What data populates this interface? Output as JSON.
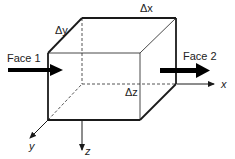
{
  "diagram": {
    "labels": {
      "dy": "Δy",
      "dx": "Δx",
      "dz": "Δz",
      "face1": "Face 1",
      "face2": "Face 2",
      "axis_x": "x",
      "axis_y": "y",
      "axis_z": "z"
    },
    "colors": {
      "line": "#1a1a1a",
      "dashed": "#555555",
      "arrow": "#000000"
    }
  }
}
